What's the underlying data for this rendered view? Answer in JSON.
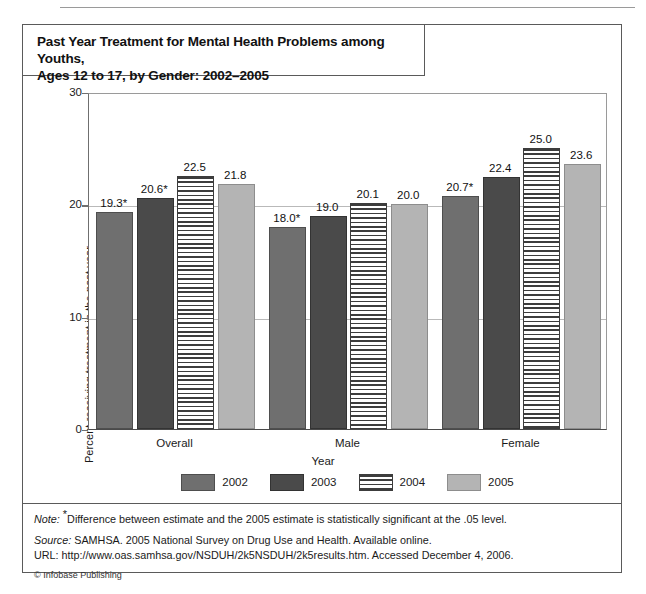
{
  "title": {
    "line1": "Past Year Treatment for Mental Health Problems among Youths,",
    "line2": "Ages 12 to 17, by Gender: 2002–2005"
  },
  "chart_data": {
    "type": "bar",
    "title": "Past Year Treatment for Mental Health Problems among Youths, Ages 12 to 17, by Gender: 2002–2005",
    "xlabel": "Year",
    "ylabel": "Percent receiving treatment in the past year",
    "ylim": [
      0,
      30
    ],
    "yticks": [
      "0",
      "10",
      "20",
      "30"
    ],
    "grid": true,
    "legend_position": "bottom",
    "categories": [
      "Overall",
      "Male",
      "Female"
    ],
    "series": [
      {
        "name": "2002",
        "color": "#6f6f6f",
        "pattern": "solid",
        "values": [
          19.3,
          18.0,
          20.7
        ],
        "labels": [
          "19.3*",
          "18.0*",
          "20.7*"
        ]
      },
      {
        "name": "2003",
        "color": "#4a4a4a",
        "pattern": "solid",
        "values": [
          20.6,
          19.0,
          22.4
        ],
        "labels": [
          "20.6*",
          "19.0",
          "22.4"
        ]
      },
      {
        "name": "2004",
        "color": "#ffffff",
        "pattern": "horizontal-stripes",
        "values": [
          22.5,
          20.1,
          25.0
        ],
        "labels": [
          "22.5",
          "20.1",
          "25.0"
        ]
      },
      {
        "name": "2005",
        "color": "#b4b4b4",
        "pattern": "solid",
        "values": [
          21.8,
          20.0,
          23.6
        ],
        "labels": [
          "21.8",
          "20.0",
          "23.6"
        ]
      }
    ]
  },
  "legend": [
    {
      "label": "2002"
    },
    {
      "label": "2003"
    },
    {
      "label": "2004"
    },
    {
      "label": "2005"
    }
  ],
  "footer": {
    "note_label": "Note:",
    "note_text": "Difference between estimate and the 2005 estimate is statistically significant at the .05 level.",
    "source_label": "Source:",
    "source_text": "SAMHSA. 2005 National Survey on Drug Use and Health. Available online.",
    "url_text": "URL: http://www.oas.samhsa.gov/NSDUH/2k5NSDUH/2k5results.htm. Accessed December 4, 2006.",
    "copyright": "© Infobase Publishing"
  }
}
